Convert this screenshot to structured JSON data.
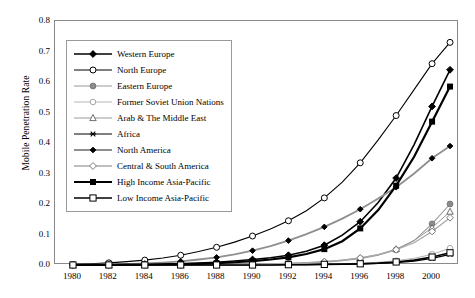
{
  "chart_data": {
    "type": "line",
    "title": "",
    "xlabel": "",
    "ylabel": "Mobile Penetration Rate",
    "xlim": [
      1979,
      2001.5
    ],
    "ylim": [
      0.0,
      0.8
    ],
    "grid": false,
    "legend_position": "upper-left-inside",
    "xticks": [
      1980,
      1982,
      1984,
      1986,
      1988,
      1990,
      1992,
      1994,
      1996,
      1998,
      2000
    ],
    "xtick_labels": [
      "1980",
      "1982",
      "1984",
      "1986",
      "1988",
      "1990",
      "1992",
      "1994",
      "1996",
      "1998",
      "2000"
    ],
    "yticks": [
      0.0,
      0.1,
      0.2,
      0.3,
      0.4,
      0.5,
      0.6,
      0.7,
      0.8
    ],
    "ytick_labels": [
      "0.0",
      "0.1",
      "0.2",
      "0.3",
      "0.4",
      "0.5",
      "0.6",
      "0.7",
      "0.8"
    ],
    "x": [
      1980,
      1981,
      1982,
      1983,
      1984,
      1985,
      1986,
      1987,
      1988,
      1989,
      1990,
      1991,
      1992,
      1993,
      1994,
      1995,
      1996,
      1997,
      1998,
      1999,
      2000,
      2001
    ],
    "series": [
      {
        "name": "Western Europe",
        "marker": "filled-diamond",
        "color": "#000000",
        "line_width": 1.6,
        "values": [
          0.0,
          0.0,
          0.001,
          0.001,
          0.002,
          0.003,
          0.004,
          0.006,
          0.009,
          0.013,
          0.018,
          0.024,
          0.032,
          0.045,
          0.065,
          0.098,
          0.142,
          0.205,
          0.285,
          0.395,
          0.52,
          0.64
        ]
      },
      {
        "name": "North Europe",
        "marker": "open-circle",
        "color": "#000000",
        "line_width": 1.1,
        "values": [
          0.002,
          0.004,
          0.007,
          0.011,
          0.016,
          0.023,
          0.032,
          0.044,
          0.058,
          0.075,
          0.095,
          0.118,
          0.145,
          0.178,
          0.22,
          0.272,
          0.335,
          0.41,
          0.49,
          0.575,
          0.66,
          0.73
        ]
      },
      {
        "name": "Eastern Europe",
        "marker": "gray-filled-circle",
        "color": "#9a9a9a",
        "line_width": 1.1,
        "values": [
          0.0,
          0.0,
          0.0,
          0.0,
          0.0,
          0.0,
          0.0,
          0.0,
          0.001,
          0.001,
          0.002,
          0.003,
          0.004,
          0.006,
          0.009,
          0.014,
          0.021,
          0.032,
          0.05,
          0.08,
          0.135,
          0.2
        ]
      },
      {
        "name": "Former Soviet Union Nations",
        "marker": "light-open-circle",
        "color": "#b5b5b5",
        "line_width": 1.0,
        "values": [
          0.0,
          0.0,
          0.0,
          0.0,
          0.0,
          0.0,
          0.0,
          0.0,
          0.0,
          0.0,
          0.0,
          0.001,
          0.001,
          0.002,
          0.003,
          0.004,
          0.006,
          0.009,
          0.014,
          0.022,
          0.035,
          0.055
        ]
      },
      {
        "name": "Arab & The Middle East",
        "marker": "triangle",
        "color": "#9a9a9a",
        "line_width": 1.0,
        "values": [
          0.0,
          0.0,
          0.0,
          0.0,
          0.0,
          0.0,
          0.001,
          0.001,
          0.002,
          0.002,
          0.003,
          0.004,
          0.006,
          0.008,
          0.011,
          0.016,
          0.023,
          0.034,
          0.052,
          0.08,
          0.122,
          0.175
        ]
      },
      {
        "name": "Africa",
        "marker": "asterisk",
        "color": "#000000",
        "line_width": 1.2,
        "values": [
          0.0,
          0.0,
          0.0,
          0.0,
          0.0,
          0.0,
          0.0,
          0.0,
          0.0,
          0.0,
          0.0,
          0.0,
          0.001,
          0.001,
          0.002,
          0.002,
          0.003,
          0.005,
          0.008,
          0.013,
          0.022,
          0.035
        ]
      },
      {
        "name": "North America",
        "marker": "small-filled-diamond",
        "color": "#8f8f8f",
        "line_width": 1.8,
        "values": [
          0.0,
          0.001,
          0.002,
          0.003,
          0.005,
          0.008,
          0.012,
          0.018,
          0.025,
          0.035,
          0.047,
          0.062,
          0.08,
          0.101,
          0.125,
          0.152,
          0.183,
          0.218,
          0.255,
          0.3,
          0.35,
          0.39
        ]
      },
      {
        "name": "Central & South America",
        "marker": "gray-open-diamond",
        "color": "#a8a8a8",
        "line_width": 1.3,
        "values": [
          0.0,
          0.0,
          0.0,
          0.0,
          0.0,
          0.0,
          0.0,
          0.0,
          0.001,
          0.001,
          0.002,
          0.003,
          0.005,
          0.007,
          0.011,
          0.016,
          0.023,
          0.034,
          0.05,
          0.073,
          0.11,
          0.155
        ]
      },
      {
        "name": "High Income Asia-Pacific",
        "marker": "filled-square",
        "color": "#000000",
        "line_width": 2.2,
        "values": [
          0.0,
          0.0,
          0.0,
          0.001,
          0.001,
          0.002,
          0.003,
          0.004,
          0.006,
          0.009,
          0.013,
          0.018,
          0.025,
          0.036,
          0.052,
          0.078,
          0.12,
          0.18,
          0.26,
          0.355,
          0.47,
          0.585
        ]
      },
      {
        "name": "Low Income Asia-Pacific",
        "marker": "open-square",
        "color": "#000000",
        "line_width": 1.6,
        "values": [
          0.0,
          0.0,
          0.0,
          0.0,
          0.0,
          0.0,
          0.0,
          0.0,
          0.0,
          0.0,
          0.0,
          0.0,
          0.001,
          0.001,
          0.002,
          0.003,
          0.004,
          0.006,
          0.01,
          0.016,
          0.026,
          0.04
        ]
      }
    ]
  }
}
